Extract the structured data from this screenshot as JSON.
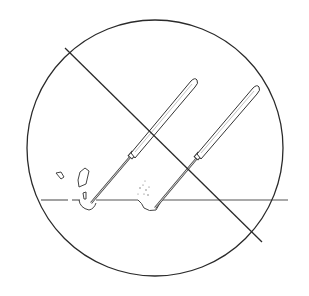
{
  "illustration": {
    "subject": "prohibition sign over two probe tools scraping a surface",
    "colors": {
      "background": "#ffffff",
      "ink": "#2a2a2a",
      "light_ink": "#777777"
    },
    "elements": [
      "prohibition-circle",
      "prohibition-slash",
      "surface-line",
      "probe-tool-left",
      "probe-tool-right",
      "debris-fragments",
      "dust-particles"
    ]
  }
}
